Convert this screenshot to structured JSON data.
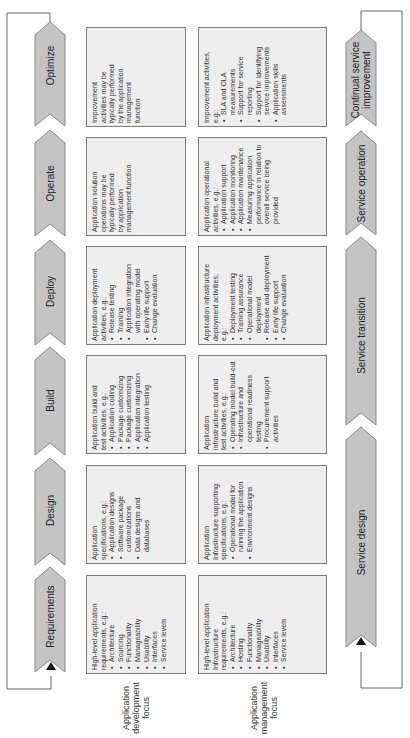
{
  "phases": [
    {
      "id": "optimize",
      "label": "Optimize"
    },
    {
      "id": "operate",
      "label": "Operate"
    },
    {
      "id": "deploy",
      "label": "Deploy"
    },
    {
      "id": "build",
      "label": "Build"
    },
    {
      "id": "design",
      "label": "Design"
    },
    {
      "id": "requirements",
      "label": "Requirements"
    }
  ],
  "service_lifecycle": [
    {
      "id": "csi",
      "label_line1": "Continual service",
      "label_line2": "improvement"
    },
    {
      "id": "operation",
      "label": "Service operation"
    },
    {
      "id": "transition",
      "label": "Service transition"
    },
    {
      "id": "design",
      "label": "Service design"
    }
  ],
  "columns": {
    "development": {
      "line1": "Application",
      "line2": "development",
      "line3": "focus"
    },
    "management": {
      "line1": "Application",
      "line2": "management",
      "line3": "focus"
    }
  },
  "development_boxes": {
    "optimize": {
      "intro": [
        "Improvement",
        "activities may be",
        "typically performed",
        "by the application",
        "management",
        "function"
      ],
      "bullets": []
    },
    "operate": {
      "intro": [
        "Application solution",
        "operations may be",
        "typically performed",
        "by application",
        "management function"
      ],
      "bullets": []
    },
    "deploy": {
      "intro": [
        "Application deployment",
        "activities, e.g.:"
      ],
      "bullets": [
        "Release testing",
        "Training",
        "Application integration with operating model",
        "Early life support",
        "Change evaluation"
      ]
    },
    "build": {
      "intro": [
        "Application build and",
        "test activities, e.g.:"
      ],
      "bullets": [
        "Application coding",
        "Package customizing",
        "Package customizing",
        "Application integration",
        "Application testing"
      ]
    },
    "design": {
      "intro": [
        "Application",
        "specifications, e.g.:"
      ],
      "bullets": [
        "Application designs",
        "Software package customizations",
        "Data designs and databases"
      ]
    },
    "requirements": {
      "intro": [
        "High-level application",
        "requirements, e.g.:"
      ],
      "bullets": [
        "Architecture",
        "Sourcing",
        "Functionality",
        "Manageability",
        "Usability",
        "Interfaces",
        "Service levels"
      ]
    }
  },
  "management_boxes": {
    "optimize": {
      "intro": [
        "Improvement activities,",
        "e.g.:"
      ],
      "bullets": [
        "SLA and OLA measurements",
        "Support for service reporting",
        "Support for identifying service improvements",
        "Application skills assessments"
      ]
    },
    "operate": {
      "intro": [
        "Application operational",
        "activities, e.g.:"
      ],
      "bullets": [
        "Application support",
        "Application monitoring",
        "Application maintenance",
        "Measuring application performance in relation to overall service being provided"
      ]
    },
    "deploy": {
      "intro": [
        "Application infrastructure",
        "deployment activities,",
        "e.g.:"
      ],
      "bullets": [
        "Deployment testing",
        "Training assurance",
        "Operational model deployment",
        "Release and deployment",
        "Early life support",
        "Change evaluation"
      ]
    },
    "build": {
      "intro": [
        "Application",
        "infrastructure build and",
        "test activities, e.g.:"
      ],
      "bullets": [
        "Operating model build-out",
        "Infrastructure and operational readiness testing",
        "Procurement support activities"
      ]
    },
    "design": {
      "intro": [
        "Application",
        "Infrastructure supporting",
        "specifications, e.g.:"
      ],
      "bullets": [
        "Operational model for running the application",
        "Environment designs"
      ]
    },
    "requirements": {
      "intro": [
        "High-level application",
        "Infrastructure",
        "requirements, e.g.:"
      ],
      "bullets": [
        "Architecture",
        "Hosting",
        "Functionality",
        "Manageability",
        "Usability",
        "Interfaces",
        "Service levels"
      ]
    }
  },
  "colors": {
    "chevron_fill": "#c4c4c4",
    "chevron_stroke": "#8a8a8a",
    "box_fill": "#eeeeee",
    "box_stroke": "#7a7a7a",
    "line": "#666666"
  }
}
